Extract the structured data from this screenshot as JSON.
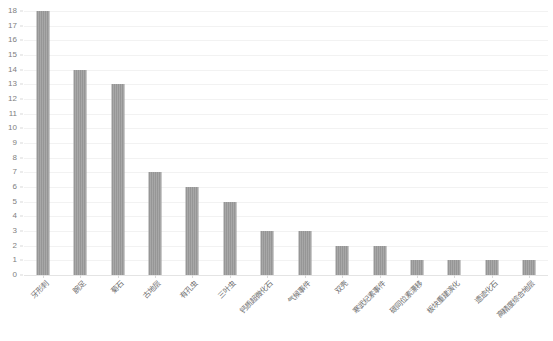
{
  "chart_data": {
    "type": "bar",
    "title": "",
    "subtitle": "",
    "xlabel": "",
    "ylabel": "",
    "ylim": [
      0,
      18
    ],
    "ytick_step": 1,
    "grid": true,
    "legend": false,
    "orientation": "vertical",
    "bar_color": "#969696",
    "categories": [
      "牙形刺",
      "腕足",
      "菊石",
      "古地层",
      "有孔虫",
      "三叶虫",
      "钙质超微化石",
      "气候事件",
      "双壳",
      "寒武纪素事件",
      "碳同位素漂移",
      "板块重建演化",
      "遗迹化石",
      "高精度综合地层"
    ],
    "values": [
      18,
      14,
      13,
      7,
      6,
      5,
      3,
      3,
      2,
      2,
      1,
      1,
      1,
      1
    ],
    "ytick_labels": [
      "18",
      "17",
      "16",
      "15",
      "14",
      "13",
      "12",
      "11",
      "10",
      "9",
      "8",
      "7",
      "6",
      "5",
      "4",
      "3",
      "2",
      "1",
      "0"
    ]
  }
}
